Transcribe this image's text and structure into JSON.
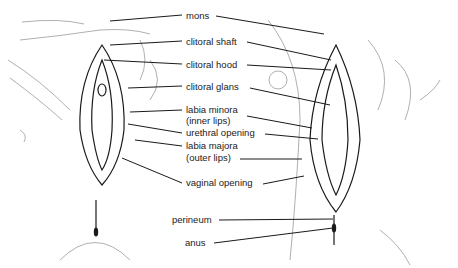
{
  "diagram": {
    "type": "anatomical-labeled-diagram",
    "labels": [
      {
        "id": "mons",
        "text": "mons",
        "x": 186,
        "y": 10
      },
      {
        "id": "clitoral_shaft",
        "text": "clitoral shaft",
        "x": 186,
        "y": 38
      },
      {
        "id": "clitoral_hood",
        "text": "clitoral hood",
        "x": 186,
        "y": 62
      },
      {
        "id": "clitoral_glans",
        "text": "clitoral glans",
        "x": 186,
        "y": 84
      },
      {
        "id": "labia_minora",
        "text": "labia minora",
        "x": 186,
        "y": 106
      },
      {
        "id": "labia_minora_sub",
        "text": "(inner lips)",
        "x": 186,
        "y": 118
      },
      {
        "id": "urethral_opening",
        "text": "urethral opening",
        "x": 186,
        "y": 130
      },
      {
        "id": "labia_majora",
        "text": "labia majora",
        "x": 186,
        "y": 142
      },
      {
        "id": "labia_majora_sub",
        "text": "(outer lips)",
        "x": 186,
        "y": 154
      },
      {
        "id": "vaginal_opening",
        "text": "vaginal opening",
        "x": 186,
        "y": 178
      },
      {
        "id": "perineum",
        "text": "perineum",
        "x": 172,
        "y": 215
      },
      {
        "id": "anus",
        "text": "anus",
        "x": 185,
        "y": 238
      }
    ],
    "colors": {
      "ink": "#1a1a1a",
      "outline": "#9a9a9a",
      "background": "#ffffff"
    }
  }
}
